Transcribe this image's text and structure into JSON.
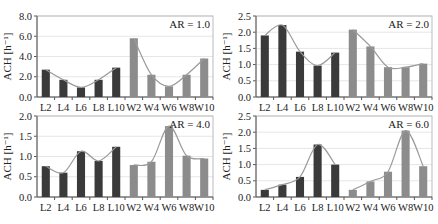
{
  "chart_data": [
    {
      "type": "bar",
      "title": "",
      "annotation": "AR = 1.0",
      "xlabel": "",
      "ylabel": "ACH [h⁻¹]",
      "ylim": [
        0,
        8.0
      ],
      "yticks": [
        "0.0",
        "2.0",
        "4.0",
        "6.0",
        "8.0"
      ],
      "ytick_values": [
        0,
        2,
        4,
        6,
        8
      ],
      "grid": true,
      "categories": [
        "L2",
        "L4",
        "L6",
        "L8",
        "L10",
        "W2",
        "W4",
        "W6",
        "W8",
        "W10"
      ],
      "values": [
        2.7,
        1.7,
        0.95,
        1.7,
        2.9,
        5.8,
        2.2,
        1.05,
        2.2,
        3.8
      ],
      "groups": {
        "L": "#3a3a3a",
        "W": "#8a8a8a"
      },
      "trend_line": true
    },
    {
      "type": "bar",
      "title": "",
      "annotation": "AR = 2.0",
      "xlabel": "",
      "ylabel": "ACH [h⁻¹]",
      "ylim": [
        0,
        2.5
      ],
      "yticks": [
        "0.0",
        "0.5",
        "1.0",
        "1.5",
        "2.0",
        "2.5"
      ],
      "ytick_values": [
        0,
        0.5,
        1.0,
        1.5,
        2.0,
        2.5
      ],
      "grid": true,
      "categories": [
        "L2",
        "L4",
        "L6",
        "L8",
        "L10",
        "W2",
        "W4",
        "W6",
        "W8",
        "W10"
      ],
      "values": [
        1.9,
        2.22,
        1.4,
        0.97,
        1.37,
        2.08,
        1.56,
        0.92,
        0.92,
        1.03
      ],
      "groups": {
        "L": "#3a3a3a",
        "W": "#8a8a8a"
      },
      "trend_line": true
    },
    {
      "type": "bar",
      "title": "",
      "annotation": "AR = 4.0",
      "xlabel": "",
      "ylabel": "ACH [h⁻¹]",
      "ylim": [
        0,
        2.0
      ],
      "yticks": [
        "0.0",
        "0.5",
        "1.0",
        "1.5",
        "2.0"
      ],
      "ytick_values": [
        0,
        0.5,
        1.0,
        1.5,
        2.0
      ],
      "grid": true,
      "categories": [
        "L2",
        "L4",
        "L6",
        "L8",
        "L10",
        "W2",
        "W4",
        "W6",
        "W8",
        "W10"
      ],
      "values": [
        0.76,
        0.6,
        1.13,
        0.89,
        1.24,
        0.79,
        0.87,
        1.75,
        1.02,
        0.95
      ],
      "groups": {
        "L": "#3a3a3a",
        "W": "#8a8a8a"
      },
      "trend_line": true
    },
    {
      "type": "bar",
      "title": "",
      "annotation": "AR = 6.0",
      "xlabel": "",
      "ylabel": "ACH [h⁻¹]",
      "ylim": [
        0,
        2.5
      ],
      "yticks": [
        "0.0",
        "0.5",
        "1.0",
        "1.5",
        "2.0",
        "2.5"
      ],
      "ytick_values": [
        0,
        0.5,
        1.0,
        1.5,
        2.0,
        2.5
      ],
      "grid": true,
      "categories": [
        "L2",
        "L4",
        "L6",
        "L8",
        "L10",
        "W2",
        "W4",
        "W6",
        "W8",
        "W10"
      ],
      "values": [
        0.22,
        0.38,
        0.62,
        1.62,
        1.0,
        0.22,
        0.48,
        0.78,
        2.05,
        0.95
      ],
      "groups": {
        "L": "#3a3a3a",
        "W": "#8a8a8a"
      },
      "trend_line": true
    }
  ],
  "colors": {
    "L_bar": "#3a3a3a",
    "W_bar": "#8c8c8c",
    "trend": "#9a9a9a",
    "grid": "#e6e6e6",
    "axis": "#555555"
  }
}
